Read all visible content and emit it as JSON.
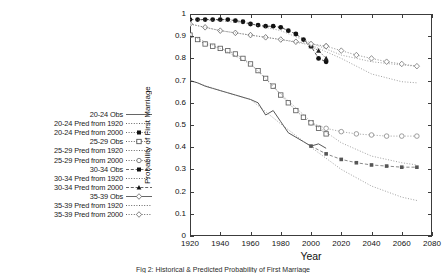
{
  "figure": {
    "caption": "Fig 2:  Historical & Predicted Probability of First Marriage"
  },
  "chart_data": {
    "type": "line",
    "title": "",
    "xlabel": "Year",
    "ylabel": "Probability of First Marriage",
    "xlim": [
      1920,
      2080
    ],
    "ylim": [
      0,
      1
    ],
    "xticks": [
      1920,
      1940,
      1960,
      1980,
      2000,
      2020,
      2040,
      2060,
      2080
    ],
    "yticks": [
      0,
      0.1,
      0.2,
      0.3,
      0.4,
      0.5,
      0.6,
      0.7,
      0.8,
      0.9,
      1
    ],
    "grid": false,
    "legend_position": "left-outside",
    "series": [
      {
        "name": "20-24 Obs",
        "style": "solid-line",
        "marker": "none",
        "color": "#444444",
        "x": [
          1920,
          1925,
          1930,
          1935,
          1940,
          1945,
          1950,
          1955,
          1960,
          1965,
          1970,
          1975,
          1980,
          1985,
          1990,
          1995,
          2000,
          2005,
          2010
        ],
        "y": [
          0.7,
          0.69,
          0.675,
          0.665,
          0.655,
          0.645,
          0.635,
          0.625,
          0.615,
          0.6,
          0.545,
          0.565,
          0.515,
          0.465,
          0.445,
          0.425,
          0.405,
          0.415,
          0.395
        ]
      },
      {
        "name": "20-24 Pred from 1920",
        "style": "dotted-line",
        "marker": "none",
        "color": "#777777",
        "x": [
          1920,
          1940,
          1960,
          1980,
          2000,
          2020,
          2040,
          2060,
          2070
        ],
        "y": [
          0.7,
          0.655,
          0.615,
          0.505,
          0.4,
          0.3,
          0.225,
          0.175,
          0.16
        ]
      },
      {
        "name": "20-24 Pred from 2000",
        "style": "dashed-line",
        "marker": "filled-square-small",
        "color": "#555555",
        "x": [
          2000,
          2010,
          2020,
          2030,
          2040,
          2050,
          2060,
          2070
        ],
        "y": [
          0.405,
          0.37,
          0.345,
          0.33,
          0.32,
          0.315,
          0.31,
          0.31
        ]
      },
      {
        "name": "25-29 Obs",
        "style": "line-marker",
        "marker": "open-square",
        "color": "#555555",
        "x": [
          1920,
          1925,
          1930,
          1935,
          1940,
          1945,
          1950,
          1955,
          1960,
          1965,
          1970,
          1975,
          1980,
          1985,
          1990,
          1995,
          2000,
          2005,
          2010
        ],
        "y": [
          0.905,
          0.885,
          0.865,
          0.855,
          0.845,
          0.835,
          0.82,
          0.8,
          0.775,
          0.745,
          0.71,
          0.675,
          0.635,
          0.6,
          0.565,
          0.535,
          0.51,
          0.485,
          0.46
        ]
      },
      {
        "name": "25-29 Pred from 1920",
        "style": "dotted-line",
        "marker": "none",
        "color": "#777777",
        "x": [
          1920,
          1940,
          1960,
          1980,
          2000,
          2020,
          2040,
          2060,
          2070
        ],
        "y": [
          0.905,
          0.845,
          0.775,
          0.64,
          0.515,
          0.42,
          0.36,
          0.33,
          0.32
        ]
      },
      {
        "name": "25-29 Pred from 2000",
        "style": "line-marker",
        "marker": "open-circle",
        "color": "#888888",
        "x": [
          2000,
          2010,
          2020,
          2030,
          2040,
          2050,
          2060,
          2070
        ],
        "y": [
          0.51,
          0.485,
          0.47,
          0.46,
          0.455,
          0.45,
          0.45,
          0.45
        ]
      },
      {
        "name": "30-34 Obs",
        "style": "dashed-marker",
        "marker": "filled-circle",
        "color": "#111111",
        "x": [
          1920,
          1925,
          1930,
          1935,
          1940,
          1945,
          1950,
          1955,
          1960,
          1965,
          1970,
          1975,
          1980,
          1985,
          1990,
          1995,
          2000,
          2005,
          2010
        ],
        "y": [
          0.975,
          0.975,
          0.975,
          0.975,
          0.975,
          0.975,
          0.97,
          0.965,
          0.955,
          0.95,
          0.945,
          0.945,
          0.94,
          0.925,
          0.91,
          0.885,
          0.855,
          0.8,
          0.785
        ]
      },
      {
        "name": "30-34 Pred from 1920",
        "style": "dotted-line",
        "marker": "none",
        "color": "#777777",
        "x": [
          1920,
          1940,
          1960,
          1980,
          2000,
          2020,
          2040,
          2060,
          2070
        ],
        "y": [
          0.975,
          0.97,
          0.955,
          0.925,
          0.87,
          0.815,
          0.785,
          0.77,
          0.765
        ]
      },
      {
        "name": "30-34 Pred from 2000",
        "style": "line-marker",
        "marker": "filled-triangle",
        "color": "#222222",
        "x": [
          2000,
          2005,
          2010
        ],
        "y": [
          0.855,
          0.835,
          0.8
        ]
      },
      {
        "name": "35-39 Obs",
        "style": "line-marker",
        "marker": "open-diamond",
        "color": "#666666",
        "x": [
          1920,
          1930,
          1940,
          1950,
          1960,
          1970,
          1980,
          1990,
          2000,
          2010
        ],
        "y": [
          0.955,
          0.94,
          0.925,
          0.915,
          0.905,
          0.895,
          0.885,
          0.875,
          0.865,
          0.855
        ]
      },
      {
        "name": "35-39 Pred from 1920",
        "style": "dotted-line",
        "marker": "none",
        "color": "#777777",
        "x": [
          1920,
          1940,
          1960,
          1980,
          2000,
          2020,
          2040,
          2060,
          2070
        ],
        "y": [
          0.955,
          0.925,
          0.905,
          0.885,
          0.86,
          0.8,
          0.73,
          0.695,
          0.69
        ]
      },
      {
        "name": "35-39 Pred from 2000",
        "style": "line-marker",
        "marker": "open-diamond",
        "color": "#777777",
        "x": [
          2010,
          2020,
          2030,
          2040,
          2050,
          2060,
          2070
        ],
        "y": [
          0.855,
          0.835,
          0.815,
          0.8,
          0.785,
          0.775,
          0.765
        ]
      }
    ]
  },
  "legend": {
    "items": [
      {
        "label": "20-24 Obs",
        "key": "solid-line"
      },
      {
        "label": "20-24 Pred from 1920",
        "key": "dotted-line"
      },
      {
        "label": "20-24 Pred from 2000",
        "key": "dotted-filled-square"
      },
      {
        "label": "25-29 Obs",
        "key": "dotted-open-square"
      },
      {
        "label": "25-29 Pred from 1920",
        "key": "dotted-line"
      },
      {
        "label": "25-29 Pred from 2000",
        "key": "dotted-open-circle"
      },
      {
        "label": "30-34 Obs",
        "key": "dashed-filled-square"
      },
      {
        "label": "30-34 Pred from 1920",
        "key": "dotted-line"
      },
      {
        "label": "30-34 Pred from 2000",
        "key": "dashed-filled-triangle"
      },
      {
        "label": "35-39 Obs",
        "key": "solid-open-diamond"
      },
      {
        "label": "35-39 Pred from 1920",
        "key": "dotted-line"
      },
      {
        "label": "35-39 Pred from 2000",
        "key": "dotted-open-diamond"
      }
    ]
  }
}
